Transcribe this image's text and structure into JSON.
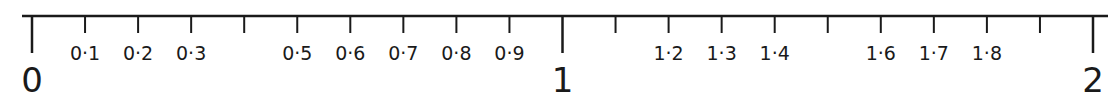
{
  "number_line": {
    "range": [
      0,
      2
    ],
    "step": 0.1,
    "major_ticks": [
      {
        "value": 0,
        "label": "0"
      },
      {
        "value": 1,
        "label": "1"
      },
      {
        "value": 2,
        "label": "2"
      }
    ],
    "minor_ticks": [
      {
        "value": 0.1,
        "label": "0·1"
      },
      {
        "value": 0.2,
        "label": "0·2"
      },
      {
        "value": 0.3,
        "label": "0·3"
      },
      {
        "value": 0.4,
        "label": ""
      },
      {
        "value": 0.5,
        "label": "0·5"
      },
      {
        "value": 0.6,
        "label": "0·6"
      },
      {
        "value": 0.7,
        "label": "0·7"
      },
      {
        "value": 0.8,
        "label": "0·8"
      },
      {
        "value": 0.9,
        "label": "0·9"
      },
      {
        "value": 1.1,
        "label": ""
      },
      {
        "value": 1.2,
        "label": "1·2"
      },
      {
        "value": 1.3,
        "label": "1·3"
      },
      {
        "value": 1.4,
        "label": "1·4"
      },
      {
        "value": 1.5,
        "label": ""
      },
      {
        "value": 1.6,
        "label": "1·6"
      },
      {
        "value": 1.7,
        "label": "1·7"
      },
      {
        "value": 1.8,
        "label": "1·8"
      },
      {
        "value": 1.9,
        "label": ""
      }
    ],
    "line_color": "#1a1a1a"
  }
}
